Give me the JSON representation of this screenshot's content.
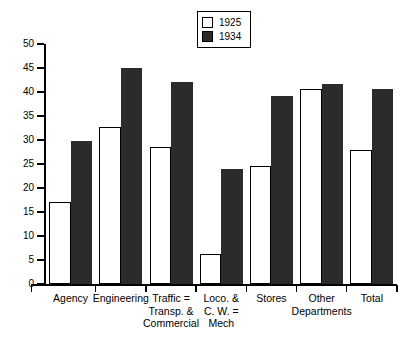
{
  "chart_data": {
    "type": "bar",
    "title": "",
    "subtitle": "",
    "xlabel": "",
    "ylabel": "",
    "ylim": [
      0,
      50
    ],
    "yticks": [
      0,
      5,
      10,
      15,
      20,
      25,
      30,
      35,
      40,
      45,
      50
    ],
    "grid": false,
    "legend_position": "top-center",
    "categories": [
      "Agency",
      "Engineering",
      "Traffic =\nTransp. &\nCommercial",
      "Loco. &\nC. W. =\nMech",
      "Stores",
      "Other\nDepartments",
      "Total"
    ],
    "series": [
      {
        "name": "1925",
        "color": "#ffffff",
        "style": "hollow",
        "values": [
          17.0,
          32.8,
          28.6,
          6.3,
          24.6,
          40.7,
          28.0
        ]
      },
      {
        "name": "1934",
        "color": "#2b2b2b",
        "style": "filled",
        "values": [
          29.7,
          45.0,
          42.1,
          24.0,
          39.2,
          41.6,
          40.6
        ]
      }
    ]
  },
  "legend": {
    "entries": [
      {
        "label": "1925",
        "style": "hollow"
      },
      {
        "label": "1934",
        "style": "filled"
      }
    ]
  },
  "axes": {
    "y_tick_labels": [
      "0",
      "5",
      "10",
      "15",
      "20",
      "25",
      "30",
      "35",
      "40",
      "45",
      "50"
    ]
  },
  "colors": {
    "axis": "#000000",
    "bar_1925": "#ffffff",
    "bar_1934": "#2b2b2b",
    "background": "#ffffff"
  }
}
